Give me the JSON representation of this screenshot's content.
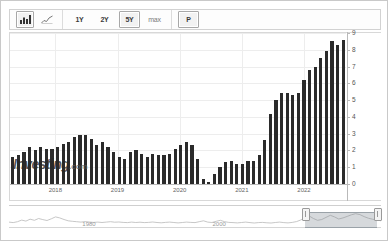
{
  "toolbar": {
    "chart_type_buttons": [
      {
        "id": "bar-chart-icon",
        "label": "bar-chart-icon",
        "selected": true
      },
      {
        "id": "line-chart-icon",
        "label": "line-chart-icon",
        "selected": false
      }
    ],
    "range_buttons": [
      {
        "label": "1Y",
        "selected": false
      },
      {
        "label": "2Y",
        "selected": false
      },
      {
        "label": "5Y",
        "selected": true
      },
      {
        "label": "max",
        "selected": false
      }
    ],
    "period_button": {
      "label": "P",
      "selected": true
    }
  },
  "watermark": {
    "brand": "Investing",
    "suffix": ".com"
  },
  "navigator": {
    "labels": [
      "1980",
      "2000"
    ],
    "selection_start_pct": 79.5,
    "selection_end_pct": 99.0,
    "left_handle_label": "range-left-handle",
    "right_handle_label": "range-right-handle"
  },
  "chart_data": {
    "type": "bar",
    "title": "",
    "subtitle": "",
    "xlabel": "",
    "ylabel": "",
    "ylim": [
      0,
      9
    ],
    "yticks": [
      0,
      1,
      2,
      3,
      4,
      5,
      6,
      7,
      8,
      9
    ],
    "ytick_labels": [
      "0",
      "1",
      "2",
      "3",
      "4",
      "5",
      "6",
      "7",
      "8",
      "9"
    ],
    "grid": true,
    "legend": "none",
    "bar_color": "#2b2b2b",
    "xticks": [
      "2018",
      "2019",
      "2020",
      "2021",
      "2022"
    ],
    "xtick_positions_pct": [
      13.5,
      32.0,
      50.5,
      69.0,
      87.5
    ],
    "categories": [
      "2017-06",
      "2017-07",
      "2017-08",
      "2017-09",
      "2017-10",
      "2017-11",
      "2017-12",
      "2018-01",
      "2018-02",
      "2018-03",
      "2018-04",
      "2018-05",
      "2018-06",
      "2018-07",
      "2018-08",
      "2018-09",
      "2018-10",
      "2018-11",
      "2018-12",
      "2019-01",
      "2019-02",
      "2019-03",
      "2019-04",
      "2019-05",
      "2019-06",
      "2019-07",
      "2019-08",
      "2019-09",
      "2019-10",
      "2019-11",
      "2019-12",
      "2020-01",
      "2020-02",
      "2020-03",
      "2020-04",
      "2020-05",
      "2020-06",
      "2020-07",
      "2020-08",
      "2020-09",
      "2020-10",
      "2020-11",
      "2020-12",
      "2021-01",
      "2021-02",
      "2021-03",
      "2021-04",
      "2021-05",
      "2021-06",
      "2021-07",
      "2021-08",
      "2021-09",
      "2021-10",
      "2021-11",
      "2021-12",
      "2022-01",
      "2022-02",
      "2022-03",
      "2022-04",
      "2022-05"
    ],
    "values": [
      1.6,
      1.7,
      1.9,
      2.2,
      2.0,
      2.2,
      2.1,
      2.1,
      2.2,
      2.4,
      2.5,
      2.8,
      2.9,
      2.9,
      2.7,
      2.3,
      2.5,
      2.2,
      1.9,
      1.6,
      1.5,
      1.9,
      2.0,
      1.8,
      1.6,
      1.8,
      1.7,
      1.7,
      1.8,
      2.1,
      2.3,
      2.5,
      2.3,
      1.5,
      0.3,
      0.1,
      0.6,
      1.0,
      1.3,
      1.4,
      1.2,
      1.2,
      1.4,
      1.4,
      1.7,
      2.6,
      4.2,
      5.0,
      5.4,
      5.4,
      5.3,
      5.4,
      6.2,
      6.8,
      7.0,
      7.5,
      7.9,
      8.5,
      8.3,
      8.6
    ]
  }
}
